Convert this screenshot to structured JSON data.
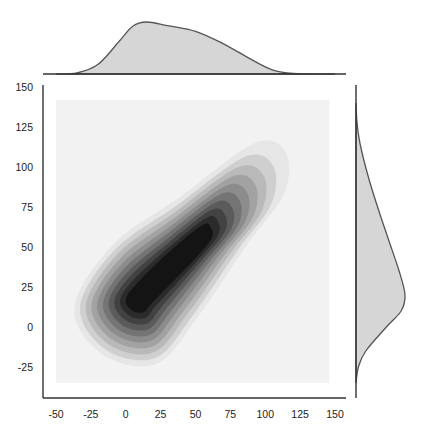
{
  "chart_data": {
    "type": "kde_jointplot",
    "title": "",
    "xlabel": "",
    "ylabel": "",
    "xlim": [
      -50,
      150
    ],
    "ylim": [
      -25,
      150
    ],
    "grid": false,
    "legend": null,
    "x_ticks": [
      -50,
      -25,
      0,
      25,
      50,
      75,
      100,
      125,
      150
    ],
    "y_ticks": [
      -25,
      0,
      25,
      50,
      75,
      100,
      125,
      150
    ],
    "x_tick_labels": [
      "-50",
      "-25",
      "0",
      "25",
      "50",
      "75",
      "100",
      "125",
      "150"
    ],
    "y_tick_labels": [
      "-25",
      "0",
      "25",
      "50",
      "75",
      "100",
      "125",
      "150"
    ],
    "kde_grid_extent": {
      "x": [
        -50,
        146
      ],
      "y": [
        -35,
        142
      ]
    },
    "joint_density": {
      "description": "Filled 2D KDE contours, grayscale, elongated along positive diagonal",
      "peak": {
        "x": 10,
        "y": 17
      },
      "secondary_ridge": {
        "x": 60,
        "y": 60
      },
      "outer_extent": {
        "x": [
          -30,
          113
        ],
        "y": [
          -17,
          113
        ]
      },
      "n_levels": 10
    },
    "marginal_x": {
      "description": "KDE of x, right-skewed",
      "points": [
        [
          -50,
          0
        ],
        [
          -35,
          0.02
        ],
        [
          -20,
          0.18
        ],
        [
          -5,
          0.62
        ],
        [
          5,
          0.92
        ],
        [
          15,
          1.0
        ],
        [
          30,
          0.93
        ],
        [
          50,
          0.82
        ],
        [
          70,
          0.58
        ],
        [
          90,
          0.28
        ],
        [
          105,
          0.08
        ],
        [
          120,
          0.01
        ],
        [
          150,
          0
        ]
      ]
    },
    "marginal_y": {
      "description": "KDE of y, peak near y=20",
      "points": [
        [
          -35,
          0
        ],
        [
          -25,
          0.05
        ],
        [
          -15,
          0.2
        ],
        [
          0,
          0.62
        ],
        [
          10,
          0.92
        ],
        [
          20,
          1.0
        ],
        [
          35,
          0.88
        ],
        [
          55,
          0.66
        ],
        [
          75,
          0.44
        ],
        [
          95,
          0.24
        ],
        [
          115,
          0.08
        ],
        [
          128,
          0.02
        ],
        [
          140,
          0
        ]
      ]
    },
    "colors": {
      "axis": "#333333",
      "marginal_fill": "#d6d6d6",
      "marginal_line": "#555555",
      "grid_bg": "#f2f2f2",
      "contour_levels": [
        "#e6e6e6",
        "#cfcfcf",
        "#b9b9b9",
        "#a2a2a2",
        "#8c8c8c",
        "#747474",
        "#5b5b5b",
        "#424242",
        "#2b2b2b",
        "#141414"
      ]
    }
  }
}
